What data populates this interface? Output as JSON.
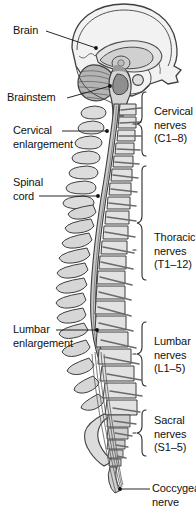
{
  "figure": {
    "type": "anatomical-diagram",
    "palette": {
      "outline": "#3a3a3a",
      "bone_fill": "#d8d8d8",
      "bone_fill_light": "#e8e8e8",
      "cord_fill": "#c9c9c9",
      "brain_fill": "#e4e4e4",
      "cerebellum_fill": "#b4b4b4",
      "background": "#ffffff",
      "text": "#111111"
    }
  },
  "labels": {
    "brain": "Brain",
    "brainstem": "Brainstem",
    "cervical_enlargement_line1": "Cervical",
    "cervical_enlargement_line2": "enlargement",
    "spinal_cord_line1": "Spinal",
    "spinal_cord_line2": "cord",
    "lumbar_enlargement_line1": "Lumbar",
    "lumbar_enlargement_line2": "enlargement",
    "cervical_nerves_line1": "Cervical",
    "cervical_nerves_line2": "nerves",
    "cervical_nerves_line3": "(C1–8)",
    "thoracic_nerves_line1": "Thoracic",
    "thoracic_nerves_line2": "nerves",
    "thoracic_nerves_line3": "(T1–12)",
    "lumbar_nerves_line1": "Lumbar",
    "lumbar_nerves_line2": "nerves",
    "lumbar_nerves_line3": "(L1–5)",
    "sacral_nerves_line1": "Sacral",
    "sacral_nerves_line2": "nerves",
    "sacral_nerves_line3": "(S1–5)",
    "coccygeal_nerve_line1": "Coccygeal",
    "coccygeal_nerve_line2": "nerve"
  },
  "nerve_groups": [
    {
      "name": "Cervical nerves",
      "range": "C1–8",
      "count": 8
    },
    {
      "name": "Thoracic nerves",
      "range": "T1–12",
      "count": 12
    },
    {
      "name": "Lumbar nerves",
      "range": "L1–5",
      "count": 5
    },
    {
      "name": "Sacral nerves",
      "range": "S1–5",
      "count": 5
    },
    {
      "name": "Coccygeal nerve",
      "range": "Co1",
      "count": 1
    }
  ]
}
